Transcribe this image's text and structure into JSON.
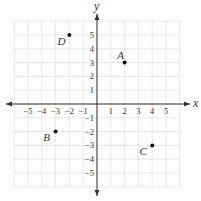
{
  "chart_data": {
    "type": "scatter",
    "title": "",
    "xlabel": "x",
    "ylabel": "y",
    "xlim": [
      -6,
      6
    ],
    "ylim": [
      -6,
      6
    ],
    "grid": true,
    "x_ticks": [
      -5,
      -4,
      -3,
      -2,
      -1,
      1,
      2,
      3,
      4,
      5
    ],
    "y_ticks": [
      5,
      4,
      3,
      2,
      1,
      -1,
      -2,
      -3,
      -4,
      -5
    ],
    "points": [
      {
        "label": "A",
        "x": 2,
        "y": 3
      },
      {
        "label": "B",
        "x": -3,
        "y": -2
      },
      {
        "label": "C",
        "x": 4,
        "y": -3
      },
      {
        "label": "D",
        "x": -2,
        "y": 5
      }
    ]
  },
  "axes": {
    "x_label": "x",
    "y_label": "y"
  },
  "colors": {
    "grid": "#c8c8c8",
    "axis": "#333333",
    "point": "#111111",
    "text": "#333333"
  }
}
